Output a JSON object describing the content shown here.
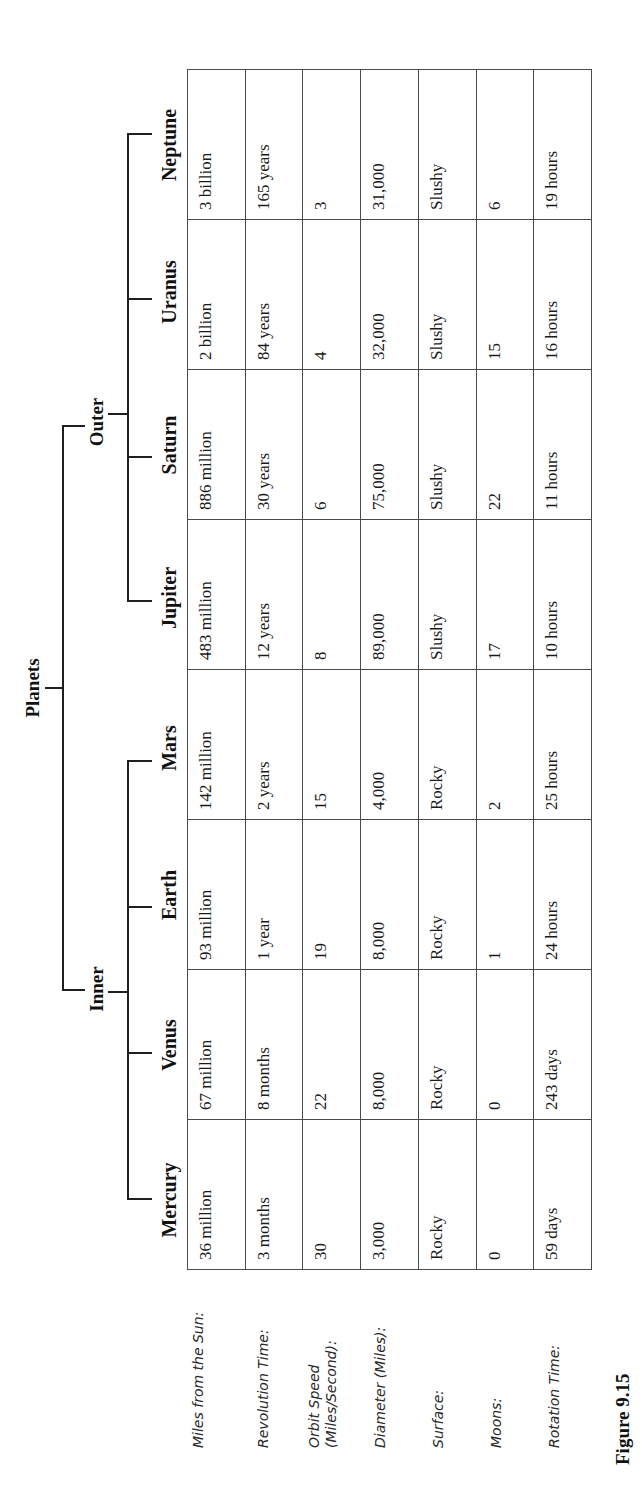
{
  "diagram": {
    "root": "Planets",
    "groups": [
      {
        "label": "Inner",
        "planets": [
          "Mercury",
          "Venus",
          "Earth",
          "Mars"
        ]
      },
      {
        "label": "Outer",
        "planets": [
          "Jupiter",
          "Saturn",
          "Uranus",
          "Neptune"
        ]
      }
    ]
  },
  "table": {
    "columns": [
      "Mercury",
      "Venus",
      "Earth",
      "Mars",
      "Jupiter",
      "Saturn",
      "Uranus",
      "Neptune"
    ],
    "rows": [
      {
        "label": "Miles from the Sun:",
        "values": [
          "36 million",
          "67 million",
          "93 million",
          "142 million",
          "483 million",
          "886 million",
          "2 billion",
          "3 billion"
        ]
      },
      {
        "label": "Revolution Time:",
        "values": [
          "3 months",
          "8 months",
          "1 year",
          "2 years",
          "12 years",
          "30 years",
          "84 years",
          "165 years"
        ]
      },
      {
        "label": "Orbit Speed (Miles/Second):",
        "values": [
          "30",
          "22",
          "19",
          "15",
          "8",
          "6",
          "4",
          "3"
        ]
      },
      {
        "label": "Diameter (Miles):",
        "values": [
          "3,000",
          "8,000",
          "8,000",
          "4,000",
          "89,000",
          "75,000",
          "32,000",
          "31,000"
        ]
      },
      {
        "label": "Surface:",
        "values": [
          "Rocky",
          "Rocky",
          "Rocky",
          "Rocky",
          "Slushy",
          "Slushy",
          "Slushy",
          "Slushy"
        ]
      },
      {
        "label": "Moons:",
        "values": [
          "0",
          "0",
          "1",
          "2",
          "17",
          "22",
          "15",
          "6"
        ]
      },
      {
        "label": "Rotation Time:",
        "values": [
          "59 days",
          "243 days",
          "24 hours",
          "25 hours",
          "10 hours",
          "11 hours",
          "16 hours",
          "19 hours"
        ]
      }
    ]
  },
  "caption": "Figure 9.15",
  "colors": {
    "lines": "#1f1f1f",
    "text": "#1a1a1a",
    "background": "#ffffff"
  }
}
